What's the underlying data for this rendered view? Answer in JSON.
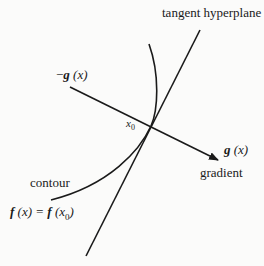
{
  "diagram": {
    "labels": {
      "tangent": "tangent hyperplane",
      "neg_gradient": "−g (x)",
      "neg_sign": "−",
      "g": "g",
      "x_paren": "(x)",
      "x0": "x",
      "x0_sub": "0",
      "gradient_vec_g": "g",
      "gradient_vec_x": "(x)",
      "gradient": "gradient",
      "contour": "contour",
      "contour_eq_f1": "f",
      "contour_eq_x": "(x) = ",
      "contour_eq_f2": "f",
      "contour_eq_paren_open": "(x",
      "contour_eq_sub": "0",
      "contour_eq_paren_close": ")"
    },
    "colors": {
      "line": "#1a1a1a",
      "background": "#fbfbfa"
    }
  }
}
